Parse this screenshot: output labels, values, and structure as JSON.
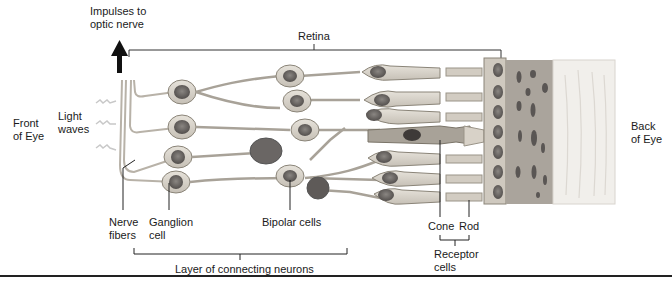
{
  "diagram": {
    "type": "retina-cross-section",
    "labels": {
      "impulses": "Impulses to\noptic nerve",
      "retina": "Retina",
      "front_of_eye": "Front\nof Eye",
      "light_waves": "Light\nwaves",
      "back_of_eye": "Back\nof Eye",
      "nerve_fibers": "Nerve\nfibers",
      "ganglion_cell": "Ganglion\ncell",
      "bipolar_cells": "Bipolar cells",
      "cone": "Cone",
      "rod": "Rod",
      "receptor_cells": "Receptor\ncells",
      "connecting_layer": "Layer of connecting neurons"
    },
    "colors": {
      "cell_fill": "#d8d2c8",
      "cell_stroke": "#8a8478",
      "nucleus": "#6e6a66",
      "dark_nucleus": "#4a4644",
      "pigment_layer": "#a8a29a",
      "choroid_light": "#f2f0ec",
      "line": "#222222"
    }
  }
}
